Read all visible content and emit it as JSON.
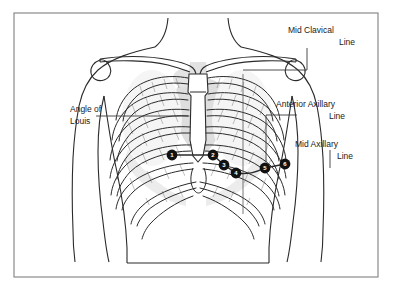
{
  "figure": {
    "background_color": "#ffffff",
    "border_color": "#8a8a8a",
    "outline_color": "#222222",
    "shadow_color": "#c9c9c9",
    "marker_fill": "#111111",
    "marker_text_color": "#ffffff"
  },
  "labels": [
    {
      "id": "mid-clavicular",
      "line1": "Mid Clavical",
      "line2": "Line"
    },
    {
      "id": "anterior-axillary",
      "line1": "Anterior Axillary",
      "line2": "Line"
    },
    {
      "id": "mid-axillary",
      "line1": "Mid Axillary",
      "line2": "Line"
    },
    {
      "id": "angle-of-louis",
      "line1": "Angle of",
      "line2": "Louis"
    }
  ],
  "electrodes": [
    {
      "number": "1",
      "x": 172,
      "y": 155
    },
    {
      "number": "2",
      "x": 213,
      "y": 155
    },
    {
      "number": "3",
      "x": 224,
      "y": 165
    },
    {
      "number": "4",
      "x": 236,
      "y": 173
    },
    {
      "number": "5",
      "x": 265,
      "y": 168
    },
    {
      "number": "6",
      "x": 285,
      "y": 164
    }
  ],
  "anatomy": {
    "body_part": "anterior-thorax",
    "structures": [
      "neck",
      "shoulders",
      "clavicles",
      "sternum",
      "ribs",
      "costal-margin",
      "heart-shadow",
      "arms"
    ]
  }
}
